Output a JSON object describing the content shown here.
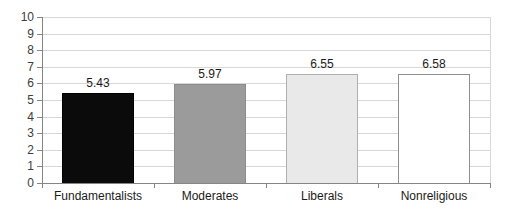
{
  "chart_data": {
    "type": "bar",
    "title": "",
    "xlabel": "",
    "ylabel": "",
    "categories": [
      "Fundamentalists",
      "Moderates",
      "Liberals",
      "Nonreligious"
    ],
    "values": [
      5.43,
      5.97,
      6.55,
      6.58
    ],
    "value_labels": [
      "5.43",
      "5.97",
      "6.55",
      "6.58"
    ],
    "bar_fill_colors": [
      "#0b0b0b",
      "#9b9b9b",
      "#e9e9e9",
      "#ffffff"
    ],
    "bar_border_colors": [
      "#000000",
      "#8c8c8c",
      "#aeaeae",
      "#8f8f8f"
    ],
    "ylim": [
      0,
      10
    ],
    "yticks": [
      0,
      1,
      2,
      3,
      4,
      5,
      6,
      7,
      8,
      9,
      10
    ],
    "grid": "horizontal",
    "legend": "none",
    "style": {
      "gridline_color": "#d8d8d8",
      "axis_color": "#858585",
      "plot_background": "#ffffff",
      "text_color": "#1a1a1a",
      "ytick_label_color": "#3c3c3c"
    }
  }
}
